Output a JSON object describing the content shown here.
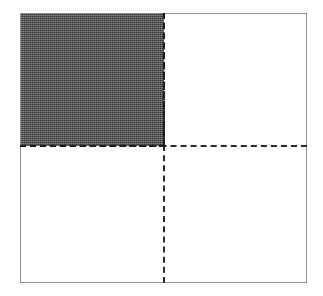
{
  "figure": {
    "background_color": "#ffffff",
    "shape": {
      "name": "outer-square",
      "stroke_color": "#8e8e8e",
      "stroke_width_px": 1,
      "fill_color": "#ffffff",
      "x_px": 20,
      "y_px": 13,
      "width_px": 287,
      "height_px": 270
    },
    "dividers": [
      {
        "name": "divider-horizontal",
        "orientation": "horizontal",
        "style": "dashed",
        "color": "#2a2a2a",
        "stroke_width_px": 2,
        "position_px": 145,
        "dash_length_px": 6,
        "gap_length_px": 4
      },
      {
        "name": "divider-vertical",
        "orientation": "vertical",
        "style": "dashed",
        "color": "#2a2a2a",
        "stroke_width_px": 2,
        "position_px": 163,
        "dash_length_px": 6,
        "gap_length_px": 4
      }
    ],
    "quadrants": [
      {
        "name": "quadrant-top-left",
        "position": "upper-left",
        "fill": "shaded",
        "fill_color": "#4a4a4a",
        "fill_pattern": "dithered-gray"
      },
      {
        "name": "quadrant-top-right",
        "position": "upper-right",
        "fill": "empty",
        "fill_color": "#ffffff",
        "fill_pattern": "none"
      },
      {
        "name": "quadrant-bottom-left",
        "position": "lower-left",
        "fill": "empty",
        "fill_color": "#ffffff",
        "fill_pattern": "none"
      },
      {
        "name": "quadrant-bottom-right",
        "position": "lower-right",
        "fill": "empty",
        "fill_color": "#ffffff",
        "fill_pattern": "none"
      }
    ]
  }
}
